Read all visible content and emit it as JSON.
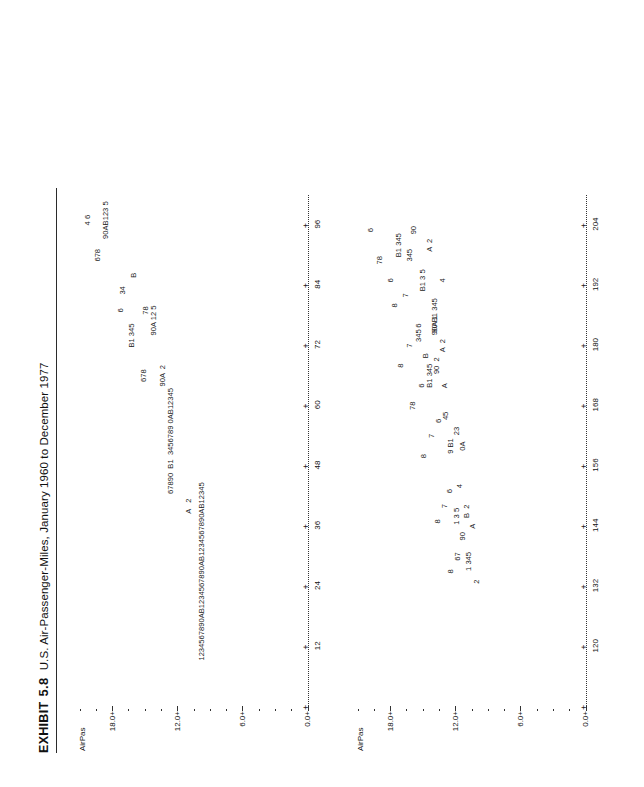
{
  "header": {
    "exhibit_word": "EXHIBIT",
    "exhibit_number": "5.8",
    "caption": "U.S. Air-Passenger-Miles, January 1960 to December 1977"
  },
  "chart_data": {
    "type": "scatter",
    "title": "U.S. Air-Passenger-Miles, January 1960 to December 1977",
    "ylabel": "AirPas",
    "xlabel": "",
    "grid": false,
    "legend": "none",
    "panels": [
      {
        "name": "panel-1",
        "ylabel": "AirPas",
        "ytick_labels": [
          "18.0+",
          "12.0+",
          "6.0+",
          "0.0+"
        ],
        "ytick_values": [
          18.0,
          12.0,
          6.0,
          0.0
        ],
        "ylim": [
          0.0,
          21.0
        ],
        "xtick_labels": [
          "12",
          "24",
          "36",
          "48",
          "60",
          "72",
          "84",
          "96"
        ],
        "xtick_values": [
          12,
          24,
          36,
          48,
          60,
          72,
          84,
          96
        ],
        "xlim": [
          0,
          102
        ],
        "rows": [
          {
            "x": 97,
            "y": 20.3,
            "text": "4 6"
          },
          {
            "x": 90,
            "y": 19.3,
            "text": "678"
          },
          {
            "x": 97,
            "y": 18.6,
            "text": "90AB123 5"
          },
          {
            "x": 79,
            "y": 17.2,
            "text": "6"
          },
          {
            "x": 83,
            "y": 17.0,
            "text": "34"
          },
          {
            "x": 74,
            "y": 16.2,
            "text": "B1 345"
          },
          {
            "x": 86,
            "y": 16.0,
            "text": "B"
          },
          {
            "x": 66,
            "y": 15.1,
            "text": "678"
          },
          {
            "x": 79,
            "y": 14.9,
            "text": "78"
          },
          {
            "x": 77,
            "y": 14.2,
            "text": "90A 12 5"
          },
          {
            "x": 66,
            "y": 13.4,
            "text": "90A  2"
          },
          {
            "x": 53,
            "y": 12.6,
            "text": "67890  B1  3456789 0AB12345"
          },
          {
            "x": 40,
            "y": 11.0,
            "text": "A   2"
          },
          {
            "x": 27,
            "y": 9.8,
            "text": "1234567890AB1234567890AB1234567890AB12345"
          }
        ]
      },
      {
        "name": "panel-2",
        "ylabel": "AirPas",
        "ytick_labels": [
          "18.0+",
          "12.0+",
          "6.0+",
          "0.0+"
        ],
        "ytick_values": [
          18.0,
          12.0,
          6.0,
          0.0
        ],
        "ylim": [
          0.0,
          21.0
        ],
        "xtick_labels": [
          "120",
          "132",
          "144",
          "156",
          "168",
          "180",
          "192",
          "204"
        ],
        "xtick_values": [
          120,
          132,
          144,
          156,
          168,
          180,
          192,
          204
        ],
        "xlim": [
          108,
          210
        ],
        "rows": [
          {
            "x": 203,
            "y": 19.8,
            "text": "6"
          },
          {
            "x": 197,
            "y": 19.0,
            "text": "78"
          },
          {
            "x": 193,
            "y": 18.0,
            "text": "6"
          },
          {
            "x": 188,
            "y": 17.6,
            "text": "8"
          },
          {
            "x": 200,
            "y": 17.2,
            "text": "B1 345"
          },
          {
            "x": 190,
            "y": 16.6,
            "text": "7"
          },
          {
            "x": 198,
            "y": 16.2,
            "text": "345"
          },
          {
            "x": 203,
            "y": 15.8,
            "text": "90"
          },
          {
            "x": 184,
            "y": 15.4,
            "text": "6"
          },
          {
            "x": 193,
            "y": 15.0,
            "text": "B1 3 5"
          },
          {
            "x": 200,
            "y": 14.4,
            "text": "A  2"
          },
          {
            "x": 186,
            "y": 13.9,
            "text": "90 B1 345"
          },
          {
            "x": 193,
            "y": 13.2,
            "text": "4"
          },
          {
            "x": 176,
            "y": 17.0,
            "text": "8"
          },
          {
            "x": 180,
            "y": 16.2,
            "text": "7"
          },
          {
            "x": 182,
            "y": 15.4,
            "text": "345"
          },
          {
            "x": 178,
            "y": 14.7,
            "text": "B"
          },
          {
            "x": 184,
            "y": 13.9,
            "text": "90A 1"
          },
          {
            "x": 180,
            "y": 13.2,
            "text": "A  2"
          },
          {
            "x": 168,
            "y": 15.9,
            "text": "78"
          },
          {
            "x": 172,
            "y": 15.1,
            "text": "6"
          },
          {
            "x": 174,
            "y": 14.4,
            "text": "B1 345"
          },
          {
            "x": 176,
            "y": 13.7,
            "text": "90  2"
          },
          {
            "x": 172,
            "y": 13.0,
            "text": "A"
          },
          {
            "x": 158,
            "y": 14.9,
            "text": "8"
          },
          {
            "x": 162,
            "y": 14.2,
            "text": "7"
          },
          {
            "x": 165,
            "y": 13.5,
            "text": "6"
          },
          {
            "x": 166,
            "y": 12.9,
            "text": "45"
          },
          {
            "x": 160,
            "y": 12.4,
            "text": "9 B1"
          },
          {
            "x": 163,
            "y": 11.9,
            "text": "23"
          },
          {
            "x": 160,
            "y": 11.3,
            "text": "0A"
          },
          {
            "x": 145,
            "y": 13.6,
            "text": "8"
          },
          {
            "x": 148,
            "y": 13.0,
            "text": "7"
          },
          {
            "x": 151,
            "y": 12.5,
            "text": "6"
          },
          {
            "x": 146,
            "y": 11.9,
            "text": "1 3 5"
          },
          {
            "x": 152,
            "y": 11.6,
            "text": "4"
          },
          {
            "x": 147,
            "y": 11.0,
            "text": "B  2"
          },
          {
            "x": 135,
            "y": 12.4,
            "text": "8"
          },
          {
            "x": 138,
            "y": 11.8,
            "text": "67"
          },
          {
            "x": 142,
            "y": 11.3,
            "text": "90"
          },
          {
            "x": 137,
            "y": 10.8,
            "text": "1 345"
          },
          {
            "x": 144,
            "y": 10.4,
            "text": "A"
          },
          {
            "x": 133,
            "y": 10.0,
            "text": "2"
          }
        ]
      }
    ]
  },
  "axes": {
    "tick_plus": "+",
    "tick_dot": "-"
  }
}
